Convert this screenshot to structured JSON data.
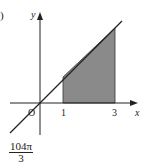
{
  "problem_tag": ")",
  "diagram": {
    "axes": {
      "x_label": "x",
      "y_label": "y",
      "origin_label": "O"
    },
    "ticks": [
      {
        "label": "1"
      },
      {
        "label": "3"
      }
    ],
    "line": {
      "description": "y = kx through origin"
    },
    "shaded_region": {
      "from_x": 1,
      "to_x": 3,
      "color": "#8a8a8a"
    }
  },
  "answer": {
    "numerator": "104π",
    "denominator": "3"
  }
}
